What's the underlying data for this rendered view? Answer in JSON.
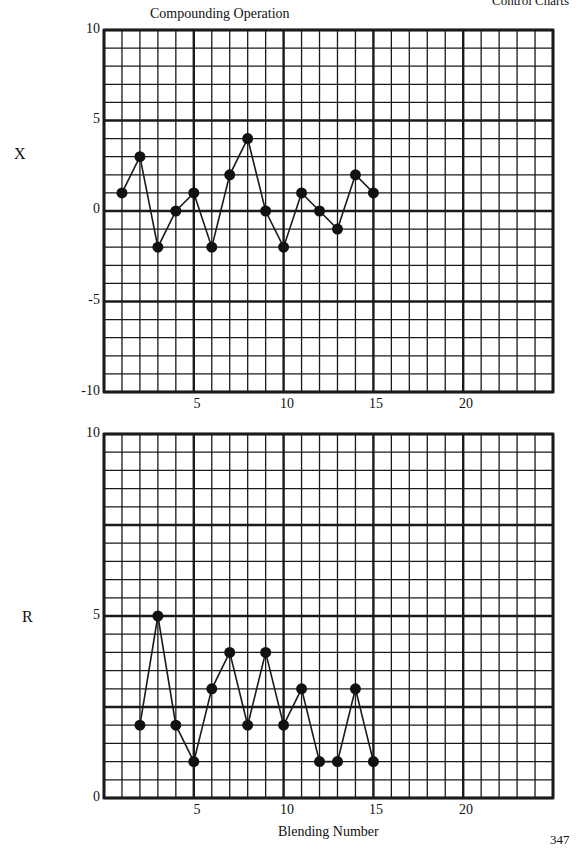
{
  "page": {
    "running_header": "Control Charts",
    "page_number": "347"
  },
  "chart_data": [
    {
      "type": "line",
      "title": "Compounding Operation",
      "ylabel": "X",
      "xlabel": "",
      "x": [
        1,
        2,
        3,
        4,
        5,
        6,
        7,
        8,
        9,
        10,
        11,
        12,
        13,
        14,
        15
      ],
      "values": [
        1,
        3,
        -2,
        0,
        1,
        -2,
        2,
        4,
        0,
        -2,
        1,
        0,
        -1,
        2,
        1
      ],
      "ylim": [
        -10,
        10
      ],
      "xlim": [
        0,
        25
      ],
      "yticks": [
        "10",
        "5",
        "0",
        "-5",
        "-10"
      ],
      "xticks": [
        "5",
        "10",
        "15",
        "20"
      ],
      "grid": true,
      "markers": "filled-circle"
    },
    {
      "type": "line",
      "title": "",
      "ylabel": "R",
      "xlabel": "Blending Number",
      "x": [
        2,
        3,
        4,
        5,
        6,
        7,
        8,
        9,
        10,
        11,
        12,
        13,
        14,
        15
      ],
      "values": [
        2,
        5,
        2,
        1,
        3,
        4,
        2,
        4,
        2,
        3,
        1,
        1,
        3,
        1
      ],
      "ylim": [
        0,
        10
      ],
      "xlim": [
        0,
        25
      ],
      "yticks": [
        "10",
        "5",
        "0"
      ],
      "xticks": [
        "5",
        "10",
        "15",
        "20"
      ],
      "grid": true,
      "markers": "filled-circle"
    }
  ]
}
